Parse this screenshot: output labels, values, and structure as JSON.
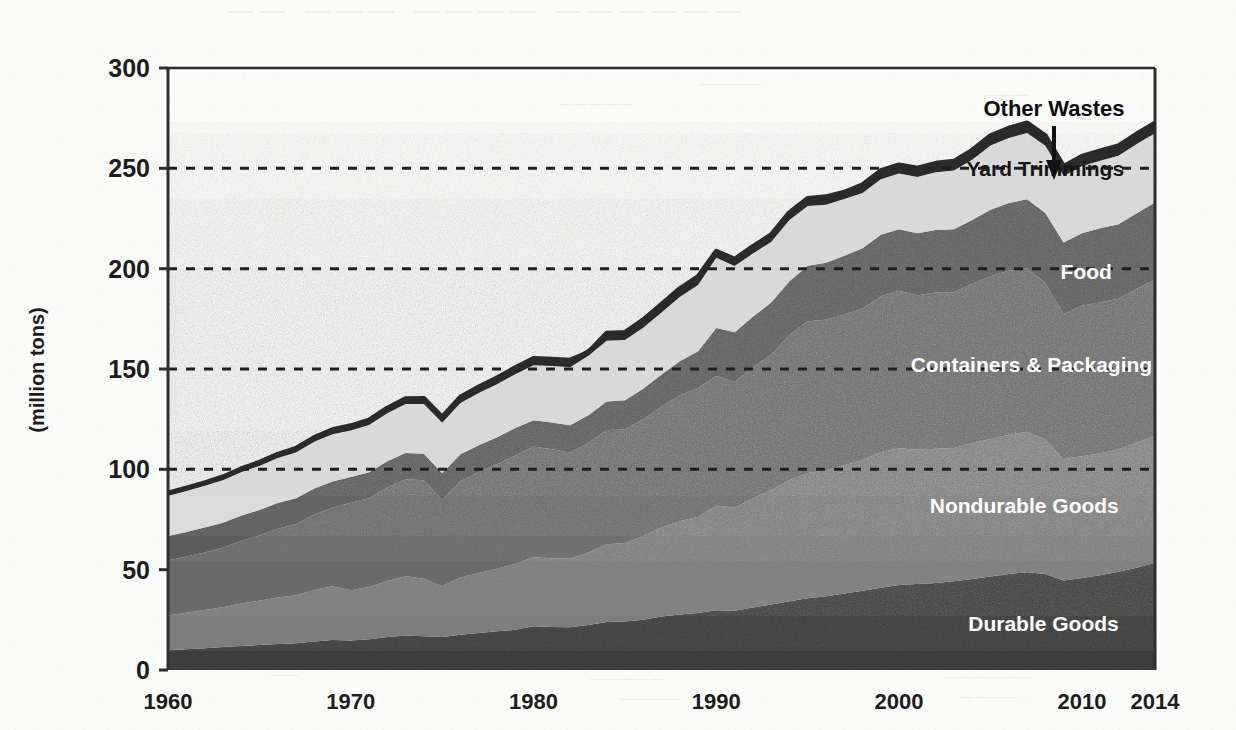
{
  "chart_data": {
    "type": "area",
    "stacked": true,
    "title": "",
    "subtitle": "",
    "xlabel": "",
    "ylabel": "(million tons)",
    "xlim": [
      1960,
      2014
    ],
    "ylim": [
      0,
      300
    ],
    "yticks": [
      0,
      50,
      100,
      150,
      200,
      250,
      300
    ],
    "ytick_labels": [
      "0",
      "50",
      "100",
      "150",
      "200",
      "250",
      "300"
    ],
    "xticks": [
      1960,
      1970,
      1980,
      1990,
      2000,
      2010,
      2014
    ],
    "xtick_labels": [
      "1960",
      "1970",
      "1980",
      "1990",
      "2000",
      "2010",
      "2014"
    ],
    "grid": "horizontal-dashed",
    "gridlines": [
      100,
      150,
      200,
      250
    ],
    "legend_position": "inline-on-areas",
    "x": [
      1960,
      1961,
      1962,
      1963,
      1964,
      1965,
      1966,
      1967,
      1968,
      1969,
      1970,
      1971,
      1972,
      1973,
      1974,
      1975,
      1976,
      1977,
      1978,
      1979,
      1980,
      1981,
      1982,
      1983,
      1984,
      1985,
      1986,
      1987,
      1988,
      1989,
      1990,
      1991,
      1992,
      1993,
      1994,
      1995,
      1996,
      1997,
      1998,
      1999,
      2000,
      2001,
      2002,
      2003,
      2004,
      2005,
      2006,
      2007,
      2008,
      2009,
      2010,
      2011,
      2012,
      2013,
      2014
    ],
    "series": [
      {
        "name": "Durable Goods",
        "color": "#3c3c3c",
        "label_color": "#ffffff",
        "values": [
          9.9,
          10.4,
          10.9,
          11.4,
          12.0,
          12.4,
          12.9,
          13.3,
          14.2,
          14.9,
          14.7,
          15.3,
          16.4,
          17.2,
          16.8,
          16.4,
          17.6,
          18.4,
          19.3,
          20.0,
          21.8,
          21.4,
          21.3,
          22.4,
          23.9,
          24.2,
          25.1,
          26.6,
          27.7,
          28.4,
          29.8,
          29.5,
          31.1,
          32.6,
          34.2,
          35.7,
          36.7,
          38.1,
          39.5,
          41.0,
          42.3,
          42.8,
          43.4,
          44.2,
          45.3,
          46.6,
          47.9,
          48.7,
          47.9,
          44.6,
          45.8,
          47.2,
          48.9,
          50.9,
          53.4
        ]
      },
      {
        "name": "Nondurable Goods",
        "color": "#7d7d7d",
        "label_color": "#ffffff",
        "values": [
          17.3,
          18.1,
          19.0,
          19.9,
          21.1,
          22.1,
          23.2,
          24.0,
          25.7,
          26.8,
          25.1,
          26.0,
          27.9,
          29.5,
          28.7,
          25.3,
          28.5,
          29.9,
          31.2,
          32.9,
          34.4,
          34.3,
          34.2,
          36.1,
          38.8,
          39.1,
          41.7,
          44.6,
          46.4,
          48.0,
          52.2,
          51.4,
          54.5,
          57.0,
          60.5,
          62.5,
          62.9,
          63.9,
          65.1,
          67.7,
          68.2,
          66.9,
          66.8,
          66.4,
          67.8,
          68.5,
          69.3,
          70.0,
          66.8,
          60.6,
          60.7,
          60.8,
          61.1,
          62.4,
          63.3
        ]
      },
      {
        "name": "Containers & Packaging",
        "color": "#6b6b6b",
        "label_color": "#ffffff",
        "values": [
          27.4,
          28.0,
          28.7,
          29.6,
          31.2,
          32.5,
          34.3,
          35.4,
          37.6,
          39.1,
          43.6,
          44.3,
          46.7,
          48.4,
          49.1,
          43.0,
          48.0,
          50.2,
          51.9,
          54.0,
          55.2,
          54.3,
          52.9,
          54.6,
          56.9,
          56.6,
          58.2,
          60.0,
          62.8,
          64.1,
          64.5,
          62.8,
          65.1,
          67.5,
          72.2,
          75.6,
          74.9,
          75.2,
          75.6,
          77.4,
          78.5,
          77.1,
          77.9,
          77.6,
          79.4,
          81.3,
          81.8,
          81.5,
          78.0,
          72.2,
          75.0,
          75.3,
          75.0,
          76.7,
          77.9
        ]
      },
      {
        "name": "Food",
        "color": "#5c5c5c",
        "label_color": "#ffffff",
        "values": [
          12.2,
          12.3,
          12.4,
          12.5,
          12.6,
          12.7,
          12.8,
          12.9,
          13.0,
          13.1,
          12.8,
          12.9,
          13.0,
          13.1,
          13.2,
          13.3,
          13.4,
          13.5,
          13.6,
          13.7,
          13.0,
          13.3,
          13.6,
          13.9,
          14.2,
          14.5,
          15.1,
          16.0,
          17.0,
          18.3,
          23.9,
          24.6,
          25.3,
          26.0,
          26.8,
          27.6,
          28.4,
          29.2,
          30.0,
          30.8,
          30.7,
          30.9,
          31.2,
          31.5,
          31.8,
          32.9,
          33.7,
          34.4,
          35.1,
          35.6,
          36.2,
          36.8,
          37.1,
          37.6,
          38.4
        ]
      },
      {
        "name": "Yard Trimmings",
        "color": "#dcdcdc",
        "label_color": "#151515",
        "values": [
          20.0,
          20.4,
          20.8,
          21.2,
          21.6,
          22.0,
          22.4,
          22.8,
          23.2,
          23.6,
          23.2,
          23.6,
          24.0,
          24.4,
          24.8,
          25.2,
          25.6,
          26.0,
          26.4,
          26.8,
          27.5,
          28.2,
          28.9,
          29.6,
          30.3,
          30.0,
          30.5,
          31.0,
          32.0,
          33.0,
          35.0,
          33.0,
          31.5,
          30.2,
          30.5,
          29.8,
          29.0,
          28.3,
          27.5,
          27.7,
          27.7,
          28.0,
          28.7,
          29.2,
          30.0,
          32.1,
          32.4,
          33.0,
          33.4,
          33.2,
          33.4,
          33.7,
          34.2,
          34.5,
          34.5
        ]
      },
      {
        "name": "Other Wastes",
        "color": "#2b2b2b",
        "label_color": "#0d0d0d",
        "values": [
          1.3,
          1.4,
          1.5,
          1.6,
          1.7,
          1.8,
          1.9,
          2.0,
          2.1,
          2.2,
          2.3,
          2.4,
          2.5,
          2.6,
          2.7,
          2.8,
          2.9,
          3.0,
          3.1,
          3.2,
          3.3,
          3.4,
          3.5,
          3.6,
          3.7,
          3.8,
          3.9,
          4.0,
          4.1,
          4.2,
          3.3,
          3.4,
          3.5,
          3.6,
          3.7,
          3.8,
          3.9,
          4.0,
          4.1,
          4.2,
          4.3,
          4.4,
          4.5,
          4.6,
          4.7,
          4.8,
          4.9,
          5.0,
          5.0,
          4.7,
          4.8,
          4.9,
          4.9,
          5.0,
          5.0
        ]
      }
    ],
    "totals": [
      88.1,
      90.6,
      93.3,
      96.2,
      100.2,
      103.5,
      107.5,
      110.4,
      115.8,
      119.7,
      121.7,
      124.5,
      130.5,
      135.2,
      135.3,
      126.0,
      136.0,
      141.0,
      145.5,
      150.6,
      155.2,
      154.9,
      154.4,
      158.2,
      167.8,
      168.2,
      174.5,
      182.2,
      190.0,
      196.0,
      208.7,
      204.7,
      211.0,
      216.9,
      227.9,
      235.0,
      235.8,
      238.1,
      241.8,
      248.8,
      251.7,
      250.1,
      252.5,
      253.5,
      259.0,
      266.2,
      270.0,
      272.6,
      266.2,
      250.9,
      255.9,
      258.7,
      261.2,
      267.1,
      272.5
    ],
    "annotations": [
      {
        "name": "other-wastes-callout",
        "text": "Other Wastes",
        "has_arrow": true,
        "arrow_target_year": 2009
      }
    ]
  },
  "axis": {
    "y_title": "(million tons)"
  }
}
